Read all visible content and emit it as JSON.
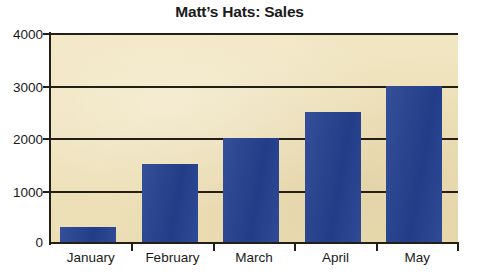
{
  "chart_data": {
    "type": "bar",
    "title": "Matt’s Hats: Sales",
    "xlabel": "",
    "ylabel": "",
    "categories": [
      "January",
      "February",
      "March",
      "April",
      "May"
    ],
    "values": [
      300,
      1500,
      2000,
      2500,
      3000
    ],
    "series": [
      {
        "name": "Sales",
        "values": [
          300,
          1500,
          2000,
          2500,
          3000
        ]
      }
    ],
    "ylim": [
      0,
      4000
    ],
    "yticks": [
      0,
      1000,
      2000,
      3000,
      4000
    ],
    "ytick_labels": [
      "0",
      "1000",
      "2000",
      "3000",
      "4000"
    ],
    "grid": true,
    "grid_axis": "y",
    "legend": false,
    "legend_position": "none",
    "colors": {
      "bar": "#254190",
      "plot_background": "#F0E3BA",
      "axis": "#231F17",
      "gridline": "#231F17",
      "text": "#1A1A1A",
      "page_background": "#FFFFFF"
    }
  }
}
